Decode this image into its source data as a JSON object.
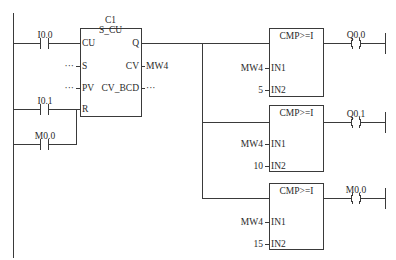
{
  "diagram": {
    "type": "ladder-logic",
    "line_color": "#3a3a3a",
    "network": {
      "counter": {
        "name": "C1",
        "type": "S_CU",
        "pins_left": [
          "CU",
          "S",
          "PV",
          "R"
        ],
        "pins_right": [
          "Q",
          "CV",
          "CV_BCD"
        ],
        "cv_output": "MW4",
        "s_input": "···",
        "pv_input": "···",
        "cv_bcd_output": "···"
      },
      "contacts": [
        {
          "label": "I0.0",
          "type": "NO",
          "connects_to": "CU"
        },
        {
          "label": "I0.1",
          "type": "NO",
          "connects_to": "R"
        },
        {
          "label": "M0.0",
          "type": "NO",
          "connects_to": "R"
        }
      ],
      "comparators": [
        {
          "title": "CMP>=I",
          "in1_label": "IN1",
          "in2_label": "IN2",
          "in1": "MW4",
          "in2": "5",
          "coil": "Q0.0"
        },
        {
          "title": "CMP>=I",
          "in1_label": "IN1",
          "in2_label": "IN2",
          "in1": "MW4",
          "in2": "10",
          "coil": "Q0.1"
        },
        {
          "title": "CMP>=I",
          "in1_label": "IN1",
          "in2_label": "IN2",
          "in1": "MW4",
          "in2": "15",
          "coil": "M0.0"
        }
      ],
      "coil_symbol": "( )"
    }
  }
}
